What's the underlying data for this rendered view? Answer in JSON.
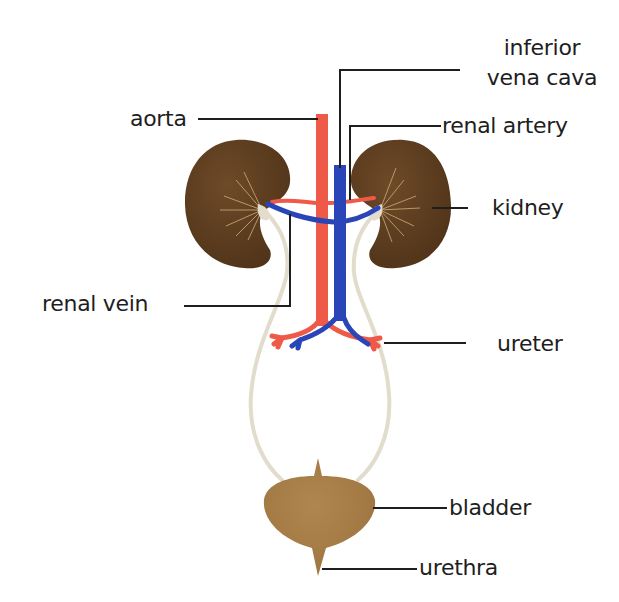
{
  "colors": {
    "background": "#ffffff",
    "kidney": "#5a3a1e",
    "kidney_highlight": "#7a5430",
    "kidney_veins": "#c9a878",
    "artery": "#ef5a48",
    "vein": "#2a45b8",
    "ureter": "#e2dccc",
    "bladder": "#a87c47",
    "leader_line": "#1e1e1e",
    "text": "#1e1e1e"
  },
  "labels": {
    "ivc_line1": "inferior",
    "ivc_line2": "vena cava",
    "aorta": "aorta",
    "renal_artery": "renal artery",
    "kidney": "kidney",
    "renal_vein": "renal vein",
    "ureter": "ureter",
    "bladder": "bladder",
    "urethra": "urethra"
  }
}
